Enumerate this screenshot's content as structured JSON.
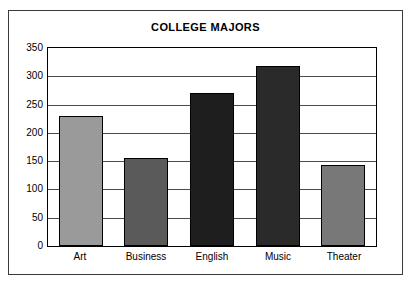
{
  "chart_data": {
    "type": "bar",
    "title": "COLLEGE MAJORS",
    "xlabel": "",
    "ylabel": "",
    "categories": [
      "Art",
      "Business",
      "English",
      "Music",
      "Theater"
    ],
    "values": [
      230,
      156,
      270,
      318,
      143
    ],
    "ylim": [
      0,
      350
    ],
    "yticks": [
      0,
      50,
      100,
      150,
      200,
      250,
      300,
      350
    ],
    "ytick_labels": [
      "0",
      "50",
      "100",
      "150",
      "200",
      "250",
      "300",
      "350"
    ],
    "grid": true,
    "legend": null,
    "bar_colors": [
      "#9a9a9a",
      "#5a5a5a",
      "#1e1e1e",
      "#2a2a2a",
      "#787878"
    ],
    "bar_edge_color": "#000000",
    "axis_color": "#000000",
    "grid_color": "#4a4a4a",
    "frame_color": "#3a3a3a",
    "background": "#ffffff"
  }
}
